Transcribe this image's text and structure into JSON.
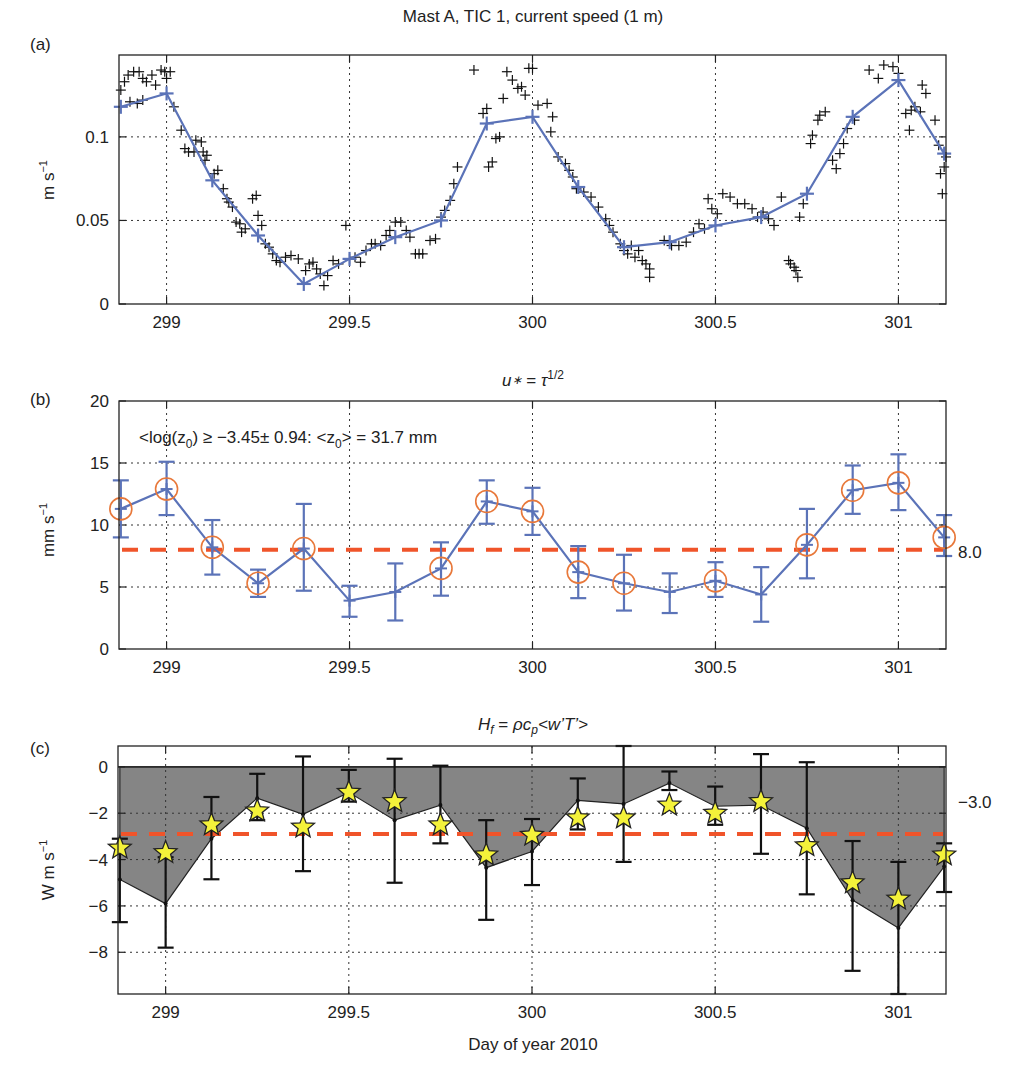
{
  "figure": {
    "xlabel": "Day of year 2010",
    "x_ticks": [
      299,
      299.5,
      300,
      300.5,
      301
    ],
    "x_tick_labels": [
      "299",
      "299.5",
      "300",
      "300.5",
      "301"
    ],
    "xlim": [
      298.87,
      301.13
    ]
  },
  "colors": {
    "blue_line": "#5b73b8",
    "orange_circle": "#e8783a",
    "red_dashed": "#f0542a",
    "shade": "#858585",
    "star_fill": "#f4f23a",
    "scatter": "#111111",
    "grid": "#333333"
  },
  "chart_data": [
    {
      "panel": "(a)",
      "type": "line+scatter",
      "title": "Mast A, TIC 1, current speed (1 m)",
      "xlabel": "",
      "ylabel": "m s⁻¹",
      "ylim": [
        0,
        0.149
      ],
      "y_ticks": [
        0,
        0.05,
        0.1
      ],
      "y_tick_labels": [
        "0",
        "0.05",
        "0.1"
      ],
      "grid": true,
      "series": [
        {
          "name": "3-hourly mean speed",
          "style": "blue line with + markers",
          "x": [
            298.875,
            299.0,
            299.125,
            299.25,
            299.375,
            299.5,
            299.625,
            299.75,
            299.875,
            300.0,
            300.125,
            300.25,
            300.375,
            300.5,
            300.625,
            300.75,
            300.875,
            301.0,
            301.125
          ],
          "values": [
            0.118,
            0.126,
            0.074,
            0.041,
            0.012,
            0.027,
            0.04,
            0.05,
            0.108,
            0.112,
            0.07,
            0.034,
            0.037,
            0.047,
            0.052,
            0.066,
            0.112,
            0.134,
            0.09
          ]
        },
        {
          "name": "raw speed samples",
          "style": "black + scatter",
          "points": [
            [
              298.875,
              0.128
            ],
            [
              298.885,
              0.133
            ],
            [
              298.895,
              0.137
            ],
            [
              298.91,
              0.139
            ],
            [
              298.925,
              0.139
            ],
            [
              298.935,
              0.135
            ],
            [
              298.945,
              0.133
            ],
            [
              298.96,
              0.137
            ],
            [
              298.97,
              0.131
            ],
            [
              298.985,
              0.14
            ],
            [
              298.995,
              0.139
            ],
            [
              299.0,
              0.135
            ],
            [
              299.01,
              0.139
            ],
            [
              298.9,
              0.121
            ],
            [
              298.92,
              0.12
            ],
            [
              298.935,
              0.122
            ],
            [
              299.02,
              0.118
            ],
            [
              299.04,
              0.104
            ],
            [
              299.05,
              0.093
            ],
            [
              299.06,
              0.091
            ],
            [
              299.075,
              0.091
            ],
            [
              299.08,
              0.098
            ],
            [
              299.095,
              0.097
            ],
            [
              299.1,
              0.091
            ],
            [
              299.105,
              0.086
            ],
            [
              299.11,
              0.089
            ],
            [
              299.13,
              0.078
            ],
            [
              299.14,
              0.08
            ],
            [
              299.155,
              0.069
            ],
            [
              299.165,
              0.063
            ],
            [
              299.17,
              0.061
            ],
            [
              299.18,
              0.058
            ],
            [
              299.19,
              0.049
            ],
            [
              299.2,
              0.048
            ],
            [
              299.205,
              0.043
            ],
            [
              299.215,
              0.045
            ],
            [
              299.235,
              0.063
            ],
            [
              299.245,
              0.065
            ],
            [
              299.25,
              0.053
            ],
            [
              299.26,
              0.047
            ],
            [
              299.27,
              0.036
            ],
            [
              299.28,
              0.034
            ],
            [
              299.29,
              0.03
            ],
            [
              299.3,
              0.026
            ],
            [
              299.31,
              0.025
            ],
            [
              299.325,
              0.028
            ],
            [
              299.34,
              0.029
            ],
            [
              299.36,
              0.027
            ],
            [
              299.38,
              0.02
            ],
            [
              299.39,
              0.024
            ],
            [
              299.4,
              0.025
            ],
            [
              299.41,
              0.021
            ],
            [
              299.42,
              0.018
            ],
            [
              299.43,
              0.011
            ],
            [
              299.44,
              0.017
            ],
            [
              299.455,
              0.026
            ],
            [
              299.47,
              0.024
            ],
            [
              299.49,
              0.047
            ],
            [
              299.5,
              0.027
            ],
            [
              299.515,
              0.028
            ],
            [
              299.53,
              0.025
            ],
            [
              299.545,
              0.032
            ],
            [
              299.56,
              0.036
            ],
            [
              299.57,
              0.036
            ],
            [
              299.585,
              0.035
            ],
            [
              299.6,
              0.041
            ],
            [
              299.61,
              0.044
            ],
            [
              299.625,
              0.049
            ],
            [
              299.64,
              0.049
            ],
            [
              299.655,
              0.044
            ],
            [
              299.665,
              0.04
            ],
            [
              299.68,
              0.03
            ],
            [
              299.69,
              0.03
            ],
            [
              299.7,
              0.03
            ],
            [
              299.72,
              0.038
            ],
            [
              299.735,
              0.039
            ],
            [
              299.75,
              0.052
            ],
            [
              299.76,
              0.056
            ],
            [
              299.775,
              0.062
            ],
            [
              299.785,
              0.072
            ],
            [
              299.795,
              0.082
            ],
            [
              299.84,
              0.14
            ],
            [
              299.865,
              0.114
            ],
            [
              299.875,
              0.117
            ],
            [
              299.88,
              0.082
            ],
            [
              299.89,
              0.085
            ],
            [
              299.9,
              0.099
            ],
            [
              299.91,
              0.1
            ],
            [
              299.92,
              0.123
            ],
            [
              299.93,
              0.139
            ],
            [
              299.945,
              0.134
            ],
            [
              299.96,
              0.129
            ],
            [
              299.97,
              0.13
            ],
            [
              299.98,
              0.125
            ],
            [
              299.99,
              0.141
            ],
            [
              300.0,
              0.141
            ],
            [
              300.015,
              0.119
            ],
            [
              300.04,
              0.12
            ],
            [
              300.055,
              0.112
            ],
            [
              300.05,
              0.103
            ],
            [
              300.07,
              0.088
            ],
            [
              300.09,
              0.084
            ],
            [
              300.1,
              0.08
            ],
            [
              300.11,
              0.076
            ],
            [
              300.12,
              0.069
            ],
            [
              300.14,
              0.067
            ],
            [
              300.16,
              0.064
            ],
            [
              300.18,
              0.058
            ],
            [
              300.2,
              0.051
            ],
            [
              300.21,
              0.047
            ],
            [
              300.22,
              0.043
            ],
            [
              300.24,
              0.036
            ],
            [
              300.25,
              0.032
            ],
            [
              300.26,
              0.03
            ],
            [
              300.28,
              0.028
            ],
            [
              300.3,
              0.026
            ],
            [
              300.32,
              0.021
            ],
            [
              300.31,
              0.024
            ],
            [
              300.29,
              0.032
            ],
            [
              300.27,
              0.035
            ],
            [
              300.32,
              0.016
            ],
            [
              300.36,
              0.038
            ],
            [
              300.38,
              0.035
            ],
            [
              300.4,
              0.035
            ],
            [
              300.42,
              0.037
            ],
            [
              300.44,
              0.043
            ],
            [
              300.455,
              0.048
            ],
            [
              300.47,
              0.045
            ],
            [
              300.48,
              0.063
            ],
            [
              300.49,
              0.057
            ],
            [
              300.505,
              0.054
            ],
            [
              300.52,
              0.066
            ],
            [
              300.54,
              0.064
            ],
            [
              300.56,
              0.06
            ],
            [
              300.58,
              0.06
            ],
            [
              300.6,
              0.057
            ],
            [
              300.615,
              0.052
            ],
            [
              300.63,
              0.055
            ],
            [
              300.645,
              0.051
            ],
            [
              300.66,
              0.047
            ],
            [
              300.68,
              0.064
            ],
            [
              300.7,
              0.026
            ],
            [
              300.705,
              0.024
            ],
            [
              300.715,
              0.022
            ],
            [
              300.725,
              0.016
            ],
            [
              300.72,
              0.02
            ],
            [
              300.73,
              0.052
            ],
            [
              300.74,
              0.06
            ],
            [
              300.76,
              0.096
            ],
            [
              300.765,
              0.101
            ],
            [
              300.78,
              0.11
            ],
            [
              300.785,
              0.113
            ],
            [
              300.8,
              0.115
            ],
            [
              300.82,
              0.086
            ],
            [
              300.83,
              0.081
            ],
            [
              300.84,
              0.09
            ],
            [
              300.85,
              0.096
            ],
            [
              300.86,
              0.105
            ],
            [
              300.88,
              0.11
            ],
            [
              300.92,
              0.14
            ],
            [
              300.945,
              0.135
            ],
            [
              300.96,
              0.143
            ],
            [
              300.985,
              0.142
            ],
            [
              301.0,
              0.138
            ],
            [
              301.02,
              0.114
            ],
            [
              301.035,
              0.116
            ],
            [
              301.045,
              0.118
            ],
            [
              301.06,
              0.115
            ],
            [
              301.065,
              0.131
            ],
            [
              301.075,
              0.126
            ],
            [
              301.03,
              0.104
            ],
            [
              301.1,
              0.11
            ],
            [
              301.11,
              0.095
            ],
            [
              301.12,
              0.066
            ],
            [
              301.125,
              0.082
            ],
            [
              301.115,
              0.078
            ],
            [
              301.13,
              0.088
            ]
          ]
        }
      ]
    },
    {
      "panel": "(b)",
      "type": "line+errorbar",
      "title": "u∗ = τ^1/2",
      "ylabel": "mm s⁻¹",
      "ylim": [
        0,
        20
      ],
      "y_ticks": [
        0,
        5,
        10,
        15,
        20
      ],
      "y_tick_labels": [
        "0",
        "5",
        "10",
        "15",
        "20"
      ],
      "grid": true,
      "annotation": "<log(z₀) ≥ −3.45± 0.94:  <z₀> = 31.7 mm",
      "reference_line": {
        "value": 8.0,
        "label": "8.0",
        "style": "red dashed"
      },
      "series": [
        {
          "name": "u* (3-hourly)",
          "x": [
            298.875,
            299.0,
            299.125,
            299.25,
            299.375,
            299.5,
            299.625,
            299.75,
            299.875,
            300.0,
            300.125,
            300.25,
            300.375,
            300.5,
            300.625,
            300.75,
            300.875,
            301.0,
            301.125
          ],
          "values": [
            11.3,
            12.9,
            8.2,
            5.3,
            8.1,
            3.9,
            4.6,
            6.5,
            11.9,
            11.1,
            6.2,
            5.3,
            4.6,
            5.5,
            4.4,
            8.4,
            12.8,
            13.4,
            9.0
          ],
          "err_low": [
            9.0,
            10.8,
            6.0,
            4.2,
            4.7,
            2.6,
            2.3,
            4.3,
            10.1,
            9.2,
            4.1,
            3.1,
            2.9,
            4.2,
            2.2,
            5.7,
            10.9,
            11.2,
            7.5
          ],
          "err_high": [
            13.6,
            15.1,
            10.4,
            6.4,
            11.7,
            5.1,
            6.9,
            8.6,
            13.6,
            13.0,
            8.3,
            7.6,
            6.1,
            7.0,
            6.6,
            11.3,
            14.8,
            15.7,
            10.8
          ],
          "circled": [
            true,
            true,
            true,
            true,
            true,
            false,
            false,
            true,
            true,
            true,
            true,
            true,
            false,
            true,
            false,
            true,
            true,
            true,
            true
          ]
        }
      ]
    },
    {
      "panel": "(c)",
      "type": "area+errorbar+scatter",
      "title": "H_f = ρc_p<w’T’>",
      "xlabel": "Day of year 2010",
      "ylabel": "W m s⁻¹",
      "ylim": [
        -9.8,
        0.9
      ],
      "y_ticks": [
        -8,
        -6,
        -4,
        -2,
        0
      ],
      "y_tick_labels": [
        "−8",
        "−6",
        "−4",
        "−2",
        "0"
      ],
      "grid": true,
      "reference_line": {
        "value": -2.9,
        "label": "−3.0",
        "style": "red dashed"
      },
      "series": [
        {
          "name": "heat flux (shaded area to zero)",
          "x": [
            298.875,
            299.0,
            299.125,
            299.25,
            299.375,
            299.5,
            299.625,
            299.75,
            299.875,
            300.0,
            300.125,
            300.25,
            300.375,
            300.5,
            300.625,
            300.75,
            300.875,
            301.0,
            301.125
          ],
          "values": [
            -4.86,
            -5.9,
            -3.1,
            -1.35,
            -2.05,
            -1.1,
            -2.3,
            -1.65,
            -4.35,
            -3.65,
            -1.45,
            -1.6,
            -0.7,
            -1.7,
            -1.65,
            -2.65,
            -5.75,
            -6.95,
            -4.3
          ],
          "err_low": [
            -6.7,
            -7.8,
            -4.85,
            -2.3,
            -4.5,
            -1.5,
            -5.0,
            -3.3,
            -6.6,
            -5.1,
            -2.7,
            -4.1,
            -1.0,
            -2.5,
            -3.75,
            -5.5,
            -8.8,
            -9.8,
            -5.4
          ],
          "err_high": [
            -3.1,
            -3.9,
            -1.3,
            -0.3,
            0.45,
            -0.13,
            0.35,
            0.05,
            -2.3,
            -2.25,
            -0.5,
            0.9,
            -0.2,
            -0.85,
            0.55,
            0.2,
            -3.2,
            -4.1,
            -3.3
          ]
        },
        {
          "name": "stars (alternate estimate)",
          "marker": "yellow star",
          "values": [
            -3.5,
            -3.7,
            -2.5,
            -1.9,
            -2.6,
            -1.1,
            -1.5,
            -2.5,
            -3.8,
            -2.95,
            -2.2,
            -2.2,
            -1.65,
            -2.0,
            -1.5,
            -3.4,
            -5.0,
            -5.7,
            -3.8
          ]
        }
      ]
    }
  ]
}
